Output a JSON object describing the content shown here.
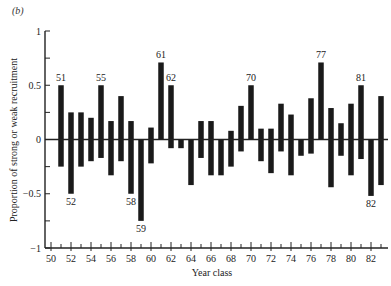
{
  "panel_label": "(b)",
  "chart_data": {
    "type": "bar",
    "title": "",
    "xlabel": "Year class",
    "ylabel": "Proportion of strong or weak recruitment",
    "xlim": [
      50,
      83
    ],
    "ylim": [
      -1,
      1
    ],
    "yticks": [
      -1,
      -0.5,
      0,
      0.5,
      1
    ],
    "ytick_labels": [
      "−1",
      "−0.5",
      "0",
      "0.5",
      "1"
    ],
    "yminor_ticks": [
      -0.75,
      -0.25,
      0.25,
      0.75
    ],
    "xticks": [
      50,
      52,
      54,
      56,
      58,
      60,
      62,
      64,
      66,
      68,
      70,
      72,
      74,
      76,
      78,
      80,
      82
    ],
    "xtick_labels": [
      "50",
      "52",
      "54",
      "56",
      "58",
      "60",
      "62",
      "64",
      "66",
      "68",
      "70",
      "72",
      "74",
      "76",
      "78",
      "80",
      "82"
    ],
    "grid": false,
    "categories": [
      51,
      52,
      53,
      54,
      55,
      56,
      57,
      58,
      59,
      60,
      61,
      62,
      63,
      64,
      65,
      66,
      67,
      68,
      69,
      70,
      71,
      72,
      73,
      74,
      75,
      76,
      77,
      78,
      79,
      80,
      81,
      82,
      83
    ],
    "series": [
      {
        "name": "Strong recruitment",
        "values": [
          0.5,
          0.25,
          0.25,
          0.2,
          0.5,
          0.17,
          0.4,
          0.17,
          0.0,
          0.11,
          0.71,
          0.5,
          0.0,
          0.0,
          0.17,
          0.17,
          0.0,
          0.08,
          0.31,
          0.5,
          0.1,
          0.1,
          0.33,
          0.23,
          0.0,
          0.38,
          0.71,
          0.29,
          0.15,
          0.33,
          0.5,
          0.0,
          0.4
        ]
      },
      {
        "name": "Weak recruitment",
        "values": [
          -0.25,
          -0.5,
          -0.25,
          -0.2,
          -0.17,
          -0.33,
          -0.2,
          -0.5,
          -0.75,
          -0.22,
          0.0,
          -0.08,
          -0.08,
          -0.42,
          -0.17,
          -0.33,
          -0.33,
          -0.25,
          -0.11,
          0.0,
          -0.2,
          -0.31,
          -0.11,
          -0.33,
          -0.15,
          -0.13,
          0.0,
          -0.44,
          -0.15,
          -0.33,
          -0.18,
          -0.52,
          -0.42
        ]
      }
    ],
    "annotations": [
      {
        "year": 51,
        "text": "51",
        "position": "above"
      },
      {
        "year": 52,
        "text": "52",
        "position": "below"
      },
      {
        "year": 55,
        "text": "55",
        "position": "above"
      },
      {
        "year": 58,
        "text": "58",
        "position": "below"
      },
      {
        "year": 59,
        "text": "59",
        "position": "below"
      },
      {
        "year": 61,
        "text": "61",
        "position": "above"
      },
      {
        "year": 62,
        "text": "62",
        "position": "above"
      },
      {
        "year": 70,
        "text": "70",
        "position": "above"
      },
      {
        "year": 77,
        "text": "77",
        "position": "above"
      },
      {
        "year": 81,
        "text": "81",
        "position": "above"
      },
      {
        "year": 82,
        "text": "82",
        "position": "below"
      }
    ]
  }
}
